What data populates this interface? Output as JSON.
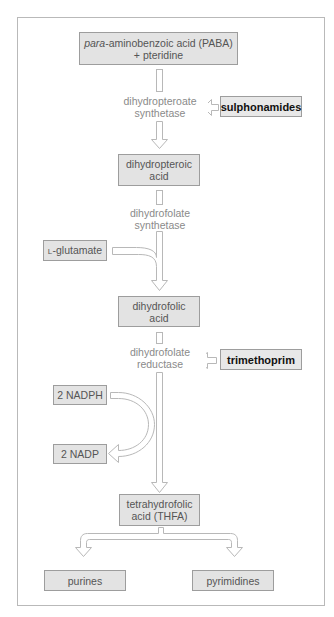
{
  "diagram": {
    "type": "metabolic-pathway",
    "title": "",
    "colors": {
      "box_fill": "#e3e3e3",
      "box_border": "#9d9d9d",
      "arrow_stroke": "#b8b8b8",
      "enzyme_text": "#8a8a8a",
      "inhibitor_text": "#111111",
      "frame_border": "#b9b9b9"
    },
    "start": {
      "prefix_italic": "para",
      "line1_rest": "-aminobenzoic acid (PABA)",
      "line2": "+ pteridine"
    },
    "steps": [
      {
        "enzyme": {
          "line1": "dihydropteroate",
          "line2": "synthetase"
        },
        "inhibitor": "sulphonamides",
        "product": {
          "line1": "dihydropteroic",
          "line2": "acid"
        }
      },
      {
        "enzyme": {
          "line1": "dihydrofolate",
          "line2": "synthetase"
        },
        "cosubstrate": {
          "prefix_smallcaps": "L",
          "rest": "-glutamate"
        },
        "product": {
          "line1": "dihydrofolic",
          "line2": "acid"
        }
      },
      {
        "enzyme": {
          "line1": "dihydrofolate",
          "line2": "reductase"
        },
        "inhibitor": "trimethoprim",
        "cofactor_in": "2 NADPH",
        "cofactor_out": "2 NADP",
        "product": {
          "line1": "tetrahydrofolic",
          "line2": "acid (THFA)"
        }
      }
    ],
    "outputs": [
      "purines",
      "pyrimidines"
    ]
  }
}
